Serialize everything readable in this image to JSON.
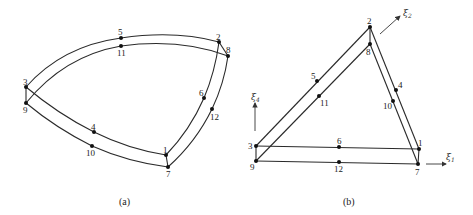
{
  "figure": {
    "panel_a": {
      "caption": "(a)",
      "description": "curved triangular prism element (distorted), 12 nodes",
      "node_labels": [
        "1",
        "2",
        "3",
        "4",
        "5",
        "6",
        "7",
        "8",
        "9",
        "10",
        "11",
        "12"
      ]
    },
    "panel_b": {
      "caption": "(b)",
      "description": "parent triangular prism element in natural coordinates, 12 nodes",
      "node_labels": [
        "1",
        "2",
        "3",
        "4",
        "5",
        "6",
        "7",
        "8",
        "9",
        "10",
        "11",
        "12"
      ],
      "axes": {
        "xi1": {
          "symbol": "ξ",
          "sub": "1"
        },
        "xi2": {
          "symbol": "ξ",
          "sub": "2"
        },
        "xi4": {
          "symbol": "ξ",
          "sub": "4"
        }
      }
    }
  }
}
